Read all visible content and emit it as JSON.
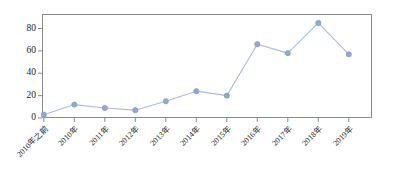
{
  "chart_data": {
    "type": "line",
    "title": "",
    "subtitle": "",
    "xlabel": "",
    "ylabel": "",
    "categories": [
      "2010年之前",
      "2010年",
      "2011年",
      "2012年",
      "2013年",
      "2014年",
      "2015年",
      "2016年",
      "2017年",
      "2018年",
      "2019年"
    ],
    "values": [
      3,
      12,
      9,
      7,
      15,
      24,
      20,
      66,
      58,
      85,
      57
    ],
    "series": [
      {
        "name": "",
        "values": [
          3,
          12,
          9,
          7,
          15,
          24,
          20,
          66,
          58,
          85,
          57
        ]
      }
    ],
    "ylim": [
      0,
      93
    ],
    "yticks": [
      0,
      20,
      40,
      60,
      80
    ],
    "ytick_labels": [
      "0",
      "20",
      "40",
      "60",
      "80"
    ],
    "grid": false,
    "legend": false,
    "legend_position": "none",
    "marker": "circle",
    "line_color": "#a8bcdd",
    "marker_color": "#8fa9d0",
    "marker_edge_color": "#7d9acb",
    "frame_color": "#8a8a8a",
    "text_color": "#1a1a1a",
    "background": "#ffffff"
  }
}
